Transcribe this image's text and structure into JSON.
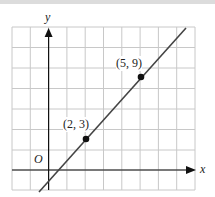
{
  "figure": {
    "axes": {
      "x_label": "x",
      "y_label": "y",
      "origin_label": "O"
    },
    "grid": {
      "columns": 10,
      "rows": 10,
      "x_step": 1,
      "y_step": 2
    },
    "points": [
      {
        "label": "(2, 3)",
        "x": 2,
        "y": 3
      },
      {
        "label": "(5, 9)",
        "x": 5,
        "y": 9
      }
    ],
    "line": {
      "slope": 2,
      "intercept": -1
    },
    "colors": {
      "grid": "#c8c8c8",
      "axis": "#111111",
      "line": "#444444"
    }
  }
}
